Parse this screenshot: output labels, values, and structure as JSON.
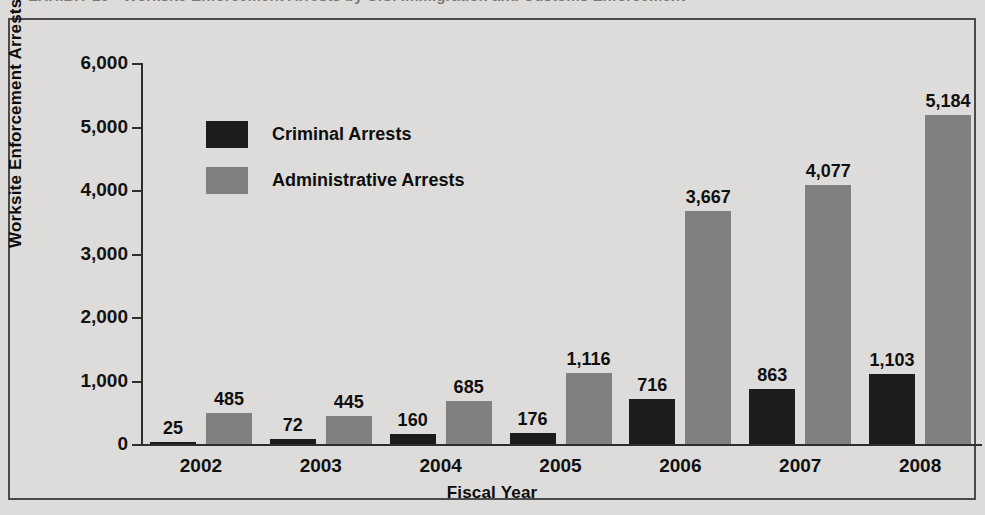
{
  "figure": {
    "exhibit_title": "EXHIBIT 25  •  Worksite Enforcement Arrests by U.S. Immigration and Customs Enforcement"
  },
  "chart_data": {
    "type": "bar",
    "title": "EXHIBIT 25  •  Worksite Enforcement Arrests by U.S. Immigration and Customs Enforcement",
    "xlabel": "Fiscal Year",
    "ylabel": "Worksite Enforcement Arrests",
    "categories": [
      "2002",
      "2003",
      "2004",
      "2005",
      "2006",
      "2007",
      "2008"
    ],
    "series": [
      {
        "name": "Criminal Arrests",
        "color": "#1c1c1c",
        "values": [
          25,
          72,
          160,
          176,
          716,
          863,
          1103
        ],
        "labels": [
          "25",
          "72",
          "160",
          "176",
          "716",
          "863",
          "1,103"
        ]
      },
      {
        "name": "Administrative Arrests",
        "color": "#808080",
        "values": [
          485,
          445,
          685,
          1116,
          3667,
          4077,
          5184
        ],
        "labels": [
          "485",
          "445",
          "685",
          "1,116",
          "3,667",
          "4,077",
          "5,184"
        ]
      }
    ],
    "ylim": [
      0,
      6000
    ],
    "yticks": [
      0,
      1000,
      2000,
      3000,
      4000,
      5000,
      6000
    ],
    "ytick_labels": [
      "0",
      "1,000",
      "2,000",
      "3,000",
      "4,000",
      "5,000",
      "6,000"
    ],
    "grid": false,
    "legend_position": "upper-left-inside"
  }
}
